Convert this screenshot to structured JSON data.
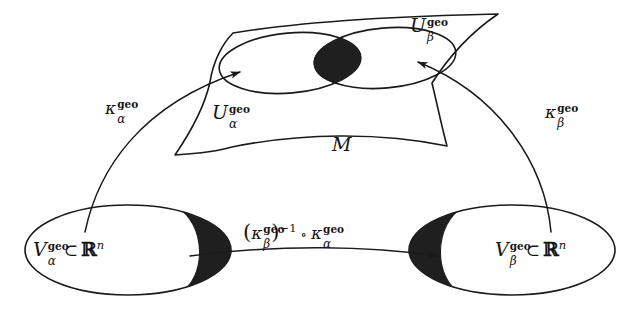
{
  "figure": {
    "caption_absent": true,
    "manifold": {
      "label": "M",
      "name": "manifold-surface"
    },
    "charts": {
      "alpha": {
        "domain_label_base": "U",
        "domain_superscript": "geo",
        "domain_subscript": "α",
        "map_label_base": "κ",
        "map_superscript": "geo",
        "map_subscript": "α",
        "codomain_label_base": "V",
        "codomain_superscript": "geo",
        "codomain_subscript": "α",
        "codomain_subset": "⊂",
        "codomain_space": "ℝ",
        "codomain_space_exponent": "n"
      },
      "beta": {
        "domain_label_base": "U",
        "domain_superscript": "geo",
        "domain_subscript": "β",
        "map_label_base": "κ",
        "map_superscript": "geo",
        "map_subscript": "β",
        "codomain_label_base": "V",
        "codomain_superscript": "geo",
        "codomain_subscript": "β",
        "codomain_subset": "⊂",
        "codomain_space": "ℝ",
        "codomain_space_exponent": "n"
      }
    },
    "transition": {
      "open_paren": "(",
      "kappa": "κ",
      "superscript": "geo",
      "subscript": "β",
      "close_paren": ")",
      "inverse_exponent": "−1",
      "compose": "∘",
      "kappa2": "κ",
      "superscript2": "geo",
      "subscript2": "α"
    },
    "colors": {
      "ink": "#1a1a1a",
      "overlap_fill": "#1f1f1f",
      "background": "#ffffff"
    }
  }
}
